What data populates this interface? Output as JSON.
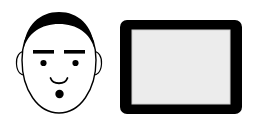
{
  "canvas": {
    "width": 257,
    "height": 132,
    "background_color": "#ffffff",
    "title": "Line-art illustration: stylized face and tablet device"
  },
  "palette": {
    "ink": "#000000",
    "paper": "#ffffff",
    "screen_gray": "#ececec",
    "screen_border": "#cfcfcf"
  },
  "figures": [
    {
      "id": "face",
      "name": "stylized-face",
      "label": "Face",
      "style": "black outline, filled black hair and features",
      "parts": [
        {
          "name": "head-outline",
          "label": "Head outline",
          "shape": "oval",
          "cx": 59,
          "cy": 65,
          "rx": 37,
          "ry": 48,
          "fill": "#ffffff",
          "stroke": "#000000",
          "stroke_width": 1.3
        },
        {
          "name": "left-ear",
          "label": "Left ear",
          "shape": "ear-arc",
          "cx": 22,
          "cy": 62,
          "rx": 5,
          "ry": 11
        },
        {
          "name": "right-ear",
          "label": "Right ear",
          "shape": "ear-arc",
          "cx": 96,
          "cy": 62,
          "rx": 5,
          "ry": 11
        },
        {
          "name": "hair",
          "label": "Hair",
          "shape": "crescent",
          "fill": "#000000"
        },
        {
          "name": "left-eyebrow",
          "label": "Left eyebrow",
          "shape": "bar",
          "x": 33,
          "y": 50,
          "width": 21,
          "height": 3.6
        },
        {
          "name": "right-eyebrow",
          "label": "Right eyebrow",
          "shape": "bar",
          "x": 64,
          "y": 50,
          "width": 21,
          "height": 3.6
        },
        {
          "name": "left-eye",
          "label": "Left eye",
          "shape": "dot",
          "cx": 43.5,
          "cy": 63,
          "r": 3.1
        },
        {
          "name": "right-eye",
          "label": "Right eye",
          "shape": "dot",
          "cx": 75.5,
          "cy": 63,
          "r": 3.1
        },
        {
          "name": "mouth",
          "label": "Mouth",
          "shape": "arc",
          "cx": 59,
          "cy": 80,
          "width": 17,
          "depth": 5
        },
        {
          "name": "chin-dot",
          "label": "Dot below mouth",
          "shape": "dot",
          "cx": 59.5,
          "cy": 94,
          "r": 4.2
        }
      ]
    },
    {
      "id": "tablet",
      "name": "tablet-device",
      "label": "Tablet",
      "style": "thick black bezel with light gray screen",
      "parts": [
        {
          "name": "tablet-body",
          "label": "Tablet body",
          "shape": "rounded-rect",
          "x": 120,
          "y": 20,
          "width": 122,
          "height": 94,
          "radius": 7,
          "fill": "#000000"
        },
        {
          "name": "tablet-screen",
          "label": "Tablet screen",
          "shape": "rect",
          "x": 132,
          "y": 30,
          "width": 98,
          "height": 74,
          "fill": "#ececec",
          "stroke": "#cfcfcf"
        }
      ]
    }
  ]
}
